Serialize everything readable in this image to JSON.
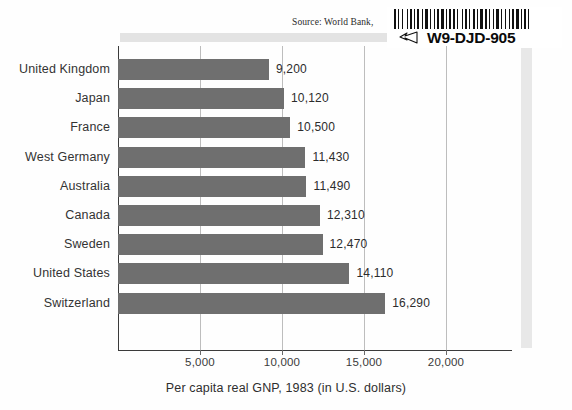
{
  "source_note": "Source: World Bank, ",
  "sticker": {
    "code": "W9-DJD-905",
    "hand_icon": "pointing-hand-icon"
  },
  "chart_data": {
    "type": "bar",
    "orientation": "horizontal",
    "title": "",
    "xlabel": "Per capita real GNP, 1983  (in U.S. dollars)",
    "ylabel": "",
    "categories": [
      "United Kingdom",
      "Japan",
      "France",
      "West Germany",
      "Australia",
      "Canada",
      "Sweden",
      "United States",
      "Switzerland"
    ],
    "values": [
      9200,
      10120,
      10500,
      11430,
      11490,
      12310,
      12470,
      14110,
      16290
    ],
    "value_labels": [
      "9,200",
      "10,120",
      "10,500",
      "11,430",
      "11,490",
      "12,310",
      "12,470",
      "14,110",
      "16,290"
    ],
    "xticks": [
      5000,
      10000,
      15000,
      20000
    ],
    "xtick_labels": [
      "5,000",
      "10,000",
      "15,000",
      "20,000"
    ],
    "xlim": [
      0,
      24000
    ],
    "grid": true,
    "legend": null,
    "bar_color": "#6f6f6f",
    "axis_color": "#3b3b3b",
    "grid_color": "#bdbdbd"
  }
}
